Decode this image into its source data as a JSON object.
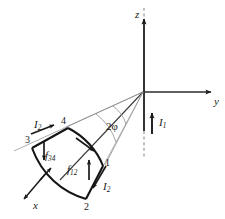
{
  "figure": {
    "background": "#ffffff",
    "ink": "#1a1a1a",
    "faint": "#9a9a9a"
  },
  "axes": {
    "z": {
      "label": "z",
      "x": 135,
      "y": 9,
      "direction": "up"
    },
    "y": {
      "label": "y",
      "x": 214,
      "y": 96,
      "direction": "right"
    },
    "x": {
      "label": "x",
      "x": 33,
      "y": 200,
      "direction": "down-left"
    },
    "origin": {
      "x": 144,
      "y": 92
    }
  },
  "currents": {
    "wire": {
      "label": "I",
      "sub": "1",
      "x": 159,
      "y": 117
    },
    "segment_top": {
      "label": "I",
      "sub": "2",
      "x": 34,
      "y": 119
    },
    "segment_bottom": {
      "label": "I",
      "sub": "2",
      "x": 103,
      "y": 181
    }
  },
  "forces": {
    "f34": {
      "label": "f",
      "sub": "34",
      "x": 45,
      "y": 150
    },
    "f12": {
      "label": "f",
      "sub": "12",
      "x": 67,
      "y": 164
    }
  },
  "angle": {
    "label": "2φ",
    "x": 106,
    "y": 121
  },
  "vertices": [
    {
      "label": "1",
      "x": 105,
      "y": 158
    },
    {
      "label": "2",
      "x": 84,
      "y": 202
    },
    {
      "label": "3",
      "x": 25,
      "y": 135
    },
    {
      "label": "4",
      "x": 61,
      "y": 116
    }
  ]
}
